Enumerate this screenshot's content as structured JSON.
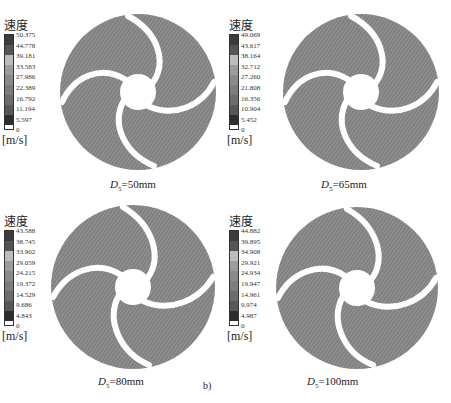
{
  "figure_label": "b)",
  "legend_title": "速度",
  "legend_unit": "[m/s]",
  "legend_colors": [
    "#3a3a3a",
    "#555555",
    "#b8b8b8",
    "#9a9a9a",
    "#8a8a8a",
    "#7a7a7a",
    "#6e6e6e",
    "#5c5c5c",
    "#333333"
  ],
  "panels": [
    {
      "caption_var": "D",
      "caption_sub": "5",
      "caption_value": "=50mm",
      "legend_values": [
        "50.375",
        "44.778",
        "39.181",
        "33.583",
        "27.986",
        "22.389",
        "16.792",
        "11.194",
        "5.597",
        "0"
      ]
    },
    {
      "caption_var": "D",
      "caption_sub": "5",
      "caption_value": "=65mm",
      "legend_values": [
        "49.069",
        "43.617",
        "38.164",
        "32.712",
        "27.260",
        "21.808",
        "16.356",
        "10.904",
        "5.452",
        "0"
      ]
    },
    {
      "caption_var": "D",
      "caption_sub": "5",
      "caption_value": "=80mm",
      "legend_values": [
        "43.588",
        "38.745",
        "33.902",
        "29.059",
        "24.215",
        "19.372",
        "14.529",
        "9.686",
        "4.843",
        "0"
      ]
    },
    {
      "caption_var": "D",
      "caption_sub": "5",
      "caption_value": "=100mm",
      "legend_values": [
        "44.882",
        "39.895",
        "34.908",
        "29.921",
        "24.934",
        "19.947",
        "14.961",
        "9.974",
        "4.987",
        "0"
      ]
    }
  ]
}
